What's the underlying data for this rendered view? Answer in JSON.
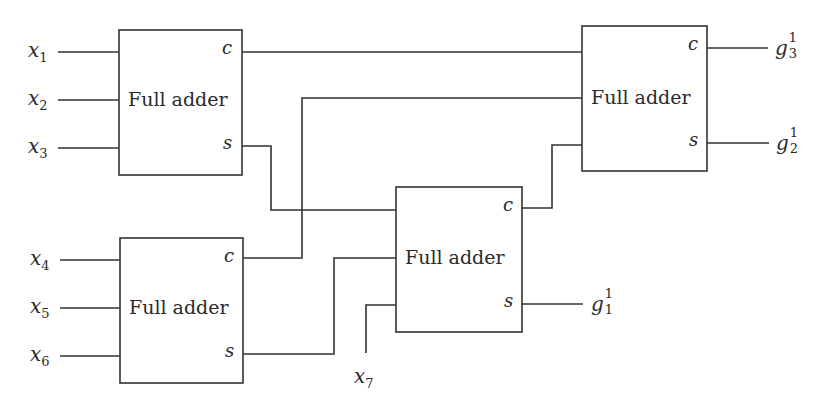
{
  "diagram": {
    "title": "",
    "blocks": [
      {
        "id": "fa1",
        "label": "Full adder",
        "carry_label": "c",
        "sum_label": "s"
      },
      {
        "id": "fa2",
        "label": "Full adder",
        "carry_label": "c",
        "sum_label": "s"
      },
      {
        "id": "fa3",
        "label": "Full adder",
        "carry_label": "c",
        "sum_label": "s"
      },
      {
        "id": "fa4",
        "label": "Full adder",
        "carry_label": "c",
        "sum_label": "s"
      }
    ],
    "inputs": [
      {
        "base": "x",
        "sub": "1"
      },
      {
        "base": "x",
        "sub": "2"
      },
      {
        "base": "x",
        "sub": "3"
      },
      {
        "base": "x",
        "sub": "4"
      },
      {
        "base": "x",
        "sub": "5"
      },
      {
        "base": "x",
        "sub": "6"
      },
      {
        "base": "x",
        "sub": "7"
      }
    ],
    "outputs": [
      {
        "base": "g",
        "sup": "1",
        "sub": "3"
      },
      {
        "base": "g",
        "sup": "1",
        "sub": "2"
      },
      {
        "base": "g",
        "sup": "1",
        "sub": "1"
      }
    ],
    "connections": [
      "x1, x2, x3 -> FA1 inputs",
      "x4, x5, x6 -> FA2 inputs",
      "FA1.s -> FA3 input 1",
      "FA2.s -> FA3 input 2",
      "x7 -> FA3 input 3",
      "FA1.c -> FA4 input 1",
      "FA2.c -> FA4 input 2",
      "FA3.c -> FA4 input 3",
      "FA3.s -> g1_1",
      "FA4.s -> g1_2",
      "FA4.c -> g1_3"
    ]
  }
}
